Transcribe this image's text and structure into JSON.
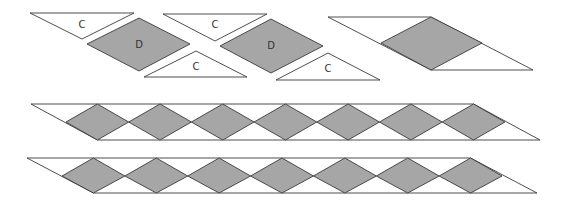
{
  "diagram": {
    "title": "",
    "colors": {
      "diamond_fill": "#a6a6a6",
      "triangle_fill": "#ffffff",
      "stroke": "#3a3a3a",
      "label": "#333333"
    },
    "exploded_pieces": [
      {
        "type": "triangle",
        "label": "C",
        "points": [
          [
            30,
            13
          ],
          [
            134,
            13
          ],
          [
            82,
            39
          ]
        ],
        "label_pos": [
          82,
          25
        ]
      },
      {
        "type": "diamond",
        "label": "D",
        "points": [
          [
            87,
            44
          ],
          [
            139,
            18
          ],
          [
            190,
            44
          ],
          [
            139,
            71
          ]
        ],
        "label_pos": [
          139,
          45
        ]
      },
      {
        "type": "triangle",
        "label": "C",
        "points": [
          [
            144,
            77
          ],
          [
            196,
            51
          ],
          [
            247,
            77
          ]
        ],
        "label_pos": [
          196,
          67
        ]
      },
      {
        "type": "triangle",
        "label": "C",
        "points": [
          [
            163,
            14
          ],
          [
            267,
            14
          ],
          [
            215,
            41
          ]
        ],
        "label_pos": [
          215,
          25
        ]
      },
      {
        "type": "diamond",
        "label": "D",
        "points": [
          [
            220,
            46
          ],
          [
            271,
            19
          ],
          [
            323,
            46
          ],
          [
            271,
            73
          ]
        ],
        "label_pos": [
          271,
          46
        ]
      },
      {
        "type": "triangle",
        "label": "C",
        "points": [
          [
            276,
            80
          ],
          [
            328,
            53
          ],
          [
            380,
            80
          ]
        ],
        "label_pos": [
          328,
          69
        ]
      }
    ],
    "assembled_unit": {
      "parallelogram": [
        [
          328,
          17
        ],
        [
          431,
          17
        ],
        [
          533,
          70
        ],
        [
          431,
          70
        ]
      ],
      "diamond": [
        [
          381,
          43
        ],
        [
          431,
          17
        ],
        [
          482,
          43
        ],
        [
          431,
          70
        ]
      ]
    },
    "strips": [
      {
        "name": "strip-1",
        "top_y": 104,
        "mid_y": 122,
        "bottom_y": 140,
        "top_left_x": 31,
        "first_diamond_left_x": 66,
        "diamond_width": 62.7,
        "diamond_count": 7,
        "bottom_right_x": 540
      },
      {
        "name": "strip-2",
        "top_y": 158,
        "mid_y": 176,
        "bottom_y": 193,
        "top_left_x": 27,
        "first_diamond_left_x": 62,
        "diamond_width": 62.86,
        "diamond_count": 7,
        "bottom_right_x": 537
      }
    ]
  }
}
